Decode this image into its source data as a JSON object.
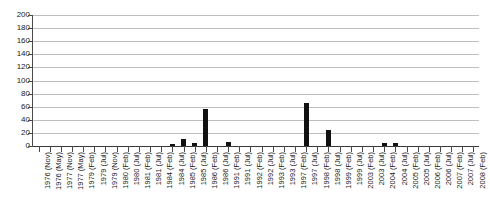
{
  "chart_data": {
    "type": "bar",
    "title": "",
    "subtitle": "",
    "xlabel": "",
    "ylabel": "",
    "ylim": [
      0,
      200
    ],
    "ytick_values": [
      0,
      20,
      40,
      60,
      80,
      100,
      120,
      140,
      160,
      180,
      200
    ],
    "ytick_labels": [
      "0",
      "20",
      "40",
      "60",
      "80",
      "100",
      "120",
      "140",
      "160",
      "180",
      "200"
    ],
    "grid": true,
    "legend": false,
    "legend_position": "none",
    "bar_color": "#111111",
    "grid_color": "#bfbfbf",
    "axis_color": "#4a4a4a",
    "categories": [
      "1976 (Nov)",
      "1976 (May)",
      "1977 (Nov)",
      "1977 (May)",
      "1979 (Feb)",
      "1979 (Jul)",
      "1979 (Nov)",
      "1980 (Feb)",
      "1980 (Jul)",
      "1981 (Feb)",
      "1981 (Jul)",
      "1984 (Feb)",
      "1984 (Jul)",
      "1985 (Feb)",
      "1985 (Jul)",
      "1986 (Feb)",
      "1986 (Jul)",
      "1991 (Feb)",
      "1991 (Jul)",
      "1992 (Feb)",
      "1992 (Jul)",
      "1993 (Feb)",
      "1993 (Jul)",
      "1997 (Feb)",
      "1997 (Jul)",
      "1998 (Feb)",
      "1998 (Jul)",
      "1999 (Feb)",
      "1999 (Jul)",
      "2003 (Feb)",
      "2003 (Jul)",
      "2004 (Feb)",
      "2004 (Jul)",
      "2005 (Feb)",
      "2005 (Jul)",
      "2006 (Feb)",
      "2006 (Jul)",
      "2007 (Feb)",
      "2007 (Jul)",
      "2008 (Feb)"
    ],
    "values": [
      0,
      0,
      0,
      0,
      0,
      0,
      0,
      0,
      0,
      0,
      0,
      0,
      3,
      10,
      5,
      57,
      0,
      6,
      0,
      0,
      0,
      0,
      0,
      0,
      65,
      0,
      25,
      0,
      0,
      0,
      0,
      4,
      4,
      0,
      0,
      0,
      0,
      0,
      0,
      0
    ]
  }
}
